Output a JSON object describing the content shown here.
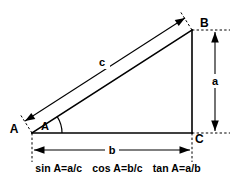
{
  "diagram": {
    "vertices": [
      {
        "name": "A",
        "label": "A",
        "x": 32,
        "y": 133
      },
      {
        "name": "B",
        "label": "B",
        "x": 192,
        "y": 30
      },
      {
        "name": "C",
        "label": "C",
        "x": 192,
        "y": 133
      }
    ],
    "angle": {
      "label": "A",
      "at_vertex": "A"
    },
    "sides": [
      {
        "name": "a",
        "label": "a",
        "description": "vertical side B to C, opposite angle A"
      },
      {
        "name": "b",
        "label": "b",
        "description": "horizontal side A to C, adjacent to angle A"
      },
      {
        "name": "c",
        "label": "c",
        "description": "hypotenuse A to B"
      }
    ],
    "colors": {
      "stroke": "#000000",
      "background": "#ffffff"
    }
  },
  "formulas": [
    {
      "name": "sine",
      "text": "sin A=a/c"
    },
    {
      "name": "cosine",
      "text": "cos A=b/c"
    },
    {
      "name": "tangent",
      "text": "tan A=a/b"
    }
  ]
}
